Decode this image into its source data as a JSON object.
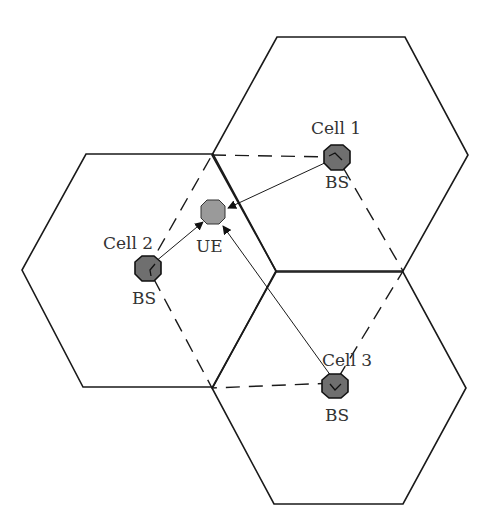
{
  "diagram": {
    "type": "cellular-network-hexagonal-cells",
    "cells": [
      {
        "id": "cell1",
        "label": "Cell 1",
        "bs_label": "BS"
      },
      {
        "id": "cell2",
        "label": "Cell 2",
        "bs_label": "BS"
      },
      {
        "id": "cell3",
        "label": "Cell 3",
        "bs_label": "BS"
      }
    ],
    "ue": {
      "label": "UE"
    },
    "links": [
      {
        "from": "cell1",
        "to": "ue"
      },
      {
        "from": "cell2",
        "to": "ue"
      },
      {
        "from": "cell3",
        "to": "ue"
      }
    ],
    "colors": {
      "line": "#1a1a1a",
      "bs_fill": "#6f6f6f",
      "ue_fill": "#9a9a9a",
      "text": "#333333",
      "background": "#ffffff"
    }
  }
}
